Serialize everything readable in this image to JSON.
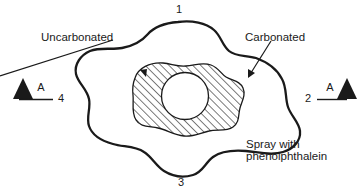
{
  "figure": {
    "title": "",
    "background_color": "#ffffff",
    "ink_color": "#1a1a1a"
  },
  "labels": {
    "uncarbonated": "Uncarbonated",
    "carbonated": "Carbonated",
    "spray_line1": "Spray with",
    "spray_line2": "phenolphthalein"
  },
  "corner_numbers": {
    "top": "1",
    "right": "2",
    "bottom": "3",
    "left": "4"
  },
  "section_markers": {
    "left_letter": "A",
    "right_letter": "A"
  },
  "regions": {
    "outer_region_name": "carbonated-zone",
    "hatched_region_name": "uncarbonated-zone",
    "center_hole_name": "reinforcement-bar-hole"
  }
}
